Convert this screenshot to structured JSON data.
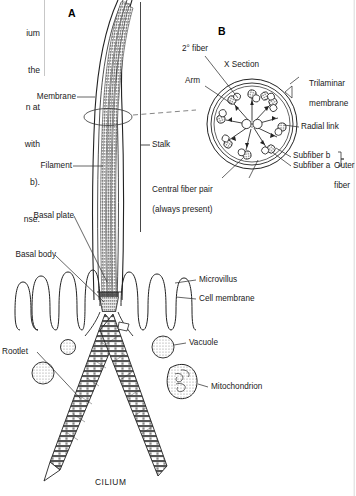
{
  "figure": {
    "caption": "CILIUM",
    "panels": [
      {
        "id": "A",
        "label": "A"
      },
      {
        "id": "B",
        "label": "B"
      }
    ]
  },
  "excerpt_text": {
    "lines": [
      "ium",
      "the",
      "n at",
      "with",
      "b).",
      "nse."
    ]
  },
  "panel_a_labels": [
    {
      "name": "membrane",
      "text": "Membrane"
    },
    {
      "name": "filament",
      "text": "Filament"
    },
    {
      "name": "basal-plate",
      "text": "Basal plate"
    },
    {
      "name": "basal-body",
      "text": "Basal body"
    },
    {
      "name": "rootlet",
      "text": "Rootlet"
    },
    {
      "name": "stalk",
      "text": "Stalk"
    },
    {
      "name": "microvillus",
      "text": "Microvillus"
    },
    {
      "name": "cell-membrane",
      "text": "Cell membrane"
    },
    {
      "name": "vacuole",
      "text": "Vacuole"
    },
    {
      "name": "mitochondrion",
      "text": "Mitochondrion"
    }
  ],
  "panel_b_labels": [
    {
      "name": "secondary-fiber",
      "text": "2° fiber"
    },
    {
      "name": "x-section",
      "text": "X Section"
    },
    {
      "name": "arm",
      "text": "Arm"
    },
    {
      "name": "trilaminar-membrane",
      "line1": "Trilaminar",
      "line2": "membrane"
    },
    {
      "name": "radial-link",
      "text": "Radial link"
    },
    {
      "name": "subfiber-b",
      "text": "Subfiber b"
    },
    {
      "name": "subfiber-a",
      "text": "Subfiber a"
    },
    {
      "name": "outer-fiber",
      "line1": "Outer",
      "line2": "fiber"
    },
    {
      "name": "central-fiber-pair",
      "line1": "Central fiber pair",
      "line2": "(always present)"
    }
  ],
  "colors": {
    "ink": "#1a1a1a",
    "line": "#222222",
    "fill_dark": "#6f6f6f",
    "fill_light": "#ffffff",
    "stipple": "#8a8a8a"
  }
}
